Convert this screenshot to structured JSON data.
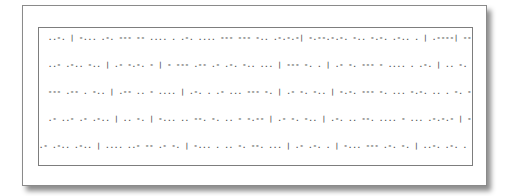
{
  "document": {
    "type": "morse-code-card",
    "lines": [
      "..-. | -... .-. --- -- .... . .-. .... --- --- -.. .-.-.-| -.--.-.-. -.. -.-. .-.. . | .----| ---..-. | - .... . | ..--.",
      "..- .-.. -.. | .- -.-. - | - --- .-- .- .-. -.. ... | --- -. . | .- -. --- - .... . .-. | .. -. | .- | ... .-- . .. .-. .. - | - ---",
      "--- .-- . -.. | .-- .. - .... | .-. . .- ... --- -. | .- -. -.. | -.-. --- -. ... -.-. .. . -. -.-. . | .- -. -.. | ... .... --- .",
      ".- ..- .- .-.. | .. -. | -... .. --. -. .. - -.-- | .- -. -.. | .-. .. --. .... - ... .-.-.- | - .... . -.-- | .- .-. . | . -. -..",
      ".- .-.. .-.. | .... ..- -- .- -. | -... . .. -. --. ... | .- .-. . | -... --- .-. -. | ..-. .-. . . | .- -. -.. | . --"
    ]
  }
}
